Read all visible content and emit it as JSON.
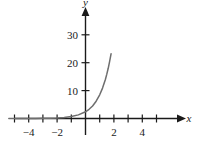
{
  "chart_data": {
    "type": "line",
    "title": "",
    "subtitle": "",
    "xlabel": "x",
    "ylabel": "y",
    "xlim": [
      -5.6,
      5.6
    ],
    "ylim": [
      -2.5,
      33
    ],
    "grid": false,
    "legend": "none",
    "x_ticks": [
      -5,
      -4,
      -3,
      -2,
      -1,
      1,
      2,
      3,
      4,
      5
    ],
    "x_tick_labels": [
      "",
      "-4",
      "",
      "-2",
      "",
      "",
      "2",
      "",
      "4",
      ""
    ],
    "y_ticks": [
      10,
      20,
      30
    ],
    "y_tick_labels": [
      "10",
      "20",
      "30"
    ],
    "series": [
      {
        "name": "exponential",
        "color": "#6e6e6e",
        "x": [
          -5.4,
          -5.0,
          -4.5,
          -4.0,
          -3.5,
          -3.0,
          -2.5,
          -2.0,
          -1.5,
          -1.0,
          -0.5,
          0.0,
          0.25,
          0.5,
          0.75,
          1.0,
          1.2,
          1.4,
          1.5,
          1.6,
          1.7,
          1.8
        ],
        "y": [
          0.0,
          0.0,
          0.01,
          0.02,
          0.03,
          0.06,
          0.1,
          0.2,
          0.37,
          0.7,
          1.3,
          2.4,
          3.3,
          4.5,
          6.2,
          8.5,
          10.9,
          14.0,
          15.9,
          18.0,
          20.5,
          23.2
        ]
      }
    ],
    "axes": {
      "x_axis_label": "x",
      "y_axis_label": "y",
      "x_arrow": true,
      "y_arrow": true
    }
  },
  "labels": {
    "x_name": "x",
    "y_name": "y",
    "x_minus4": "−4",
    "x_minus2": "−2",
    "x_2": "2",
    "x_4": "4",
    "y_10": "10",
    "y_20": "20",
    "y_30": "30"
  },
  "colors": {
    "curve": "#6e6e6e",
    "axis": "#1a1a1a",
    "background": "#ffffff"
  }
}
